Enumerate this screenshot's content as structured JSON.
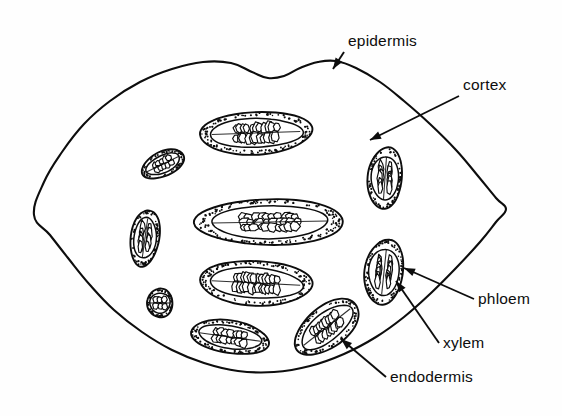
{
  "figure": {
    "kind": "botanical-line-drawing",
    "background_color": "#fefefe",
    "ink_color": "#0d0d0d",
    "width": 562,
    "height": 416
  },
  "labels": [
    {
      "id": "epidermis",
      "text": "epidermis",
      "x": 348,
      "y": 46,
      "anchor": "start",
      "leader": {
        "from": [
          344,
          52
        ],
        "to": [
          333,
          69
        ]
      }
    },
    {
      "id": "cortex",
      "text": "cortex",
      "x": 463,
      "y": 90,
      "anchor": "start",
      "leader": {
        "from": [
          459,
          96
        ],
        "to": [
          370,
          140
        ]
      }
    },
    {
      "id": "phloem",
      "text": "phloem",
      "x": 478,
      "y": 304,
      "anchor": "start",
      "leader": {
        "from": [
          474,
          299
        ],
        "to": [
          404,
          268
        ]
      }
    },
    {
      "id": "xylem",
      "text": "xylem",
      "x": 443,
      "y": 348,
      "anchor": "start",
      "leader": {
        "from": [
          439,
          343
        ],
        "to": [
          396,
          281
        ]
      }
    },
    {
      "id": "endodermis",
      "text": "endodermis",
      "x": 390,
      "y": 382,
      "anchor": "start",
      "leader": {
        "from": [
          386,
          377
        ],
        "to": [
          341,
          339
        ]
      }
    }
  ],
  "structures": {
    "epidermis": {
      "label": "epidermis",
      "description": "outer boundary line of the stem"
    },
    "cortex": {
      "label": "cortex",
      "description": "stippled ground tissue between epidermis and bundles"
    },
    "endodermis": {
      "label": "endodermis",
      "description": "sheath enclosing each vascular bundle"
    },
    "phloem": {
      "label": "phloem",
      "description": "small cells at outer side of bundle"
    },
    "xylem": {
      "label": "xylem",
      "description": "large vessel cells within bundle"
    }
  },
  "outline": {
    "name": "stem-epidermis-outline",
    "points": [
      [
        34,
        215
      ],
      [
        44,
        182
      ],
      [
        62,
        152
      ],
      [
        84,
        124
      ],
      [
        110,
        101
      ],
      [
        140,
        82
      ],
      [
        172,
        69
      ],
      [
        203,
        62
      ],
      [
        231,
        63
      ],
      [
        252,
        72
      ],
      [
        268,
        78
      ],
      [
        284,
        76
      ],
      [
        300,
        68
      ],
      [
        318,
        62
      ],
      [
        336,
        61
      ],
      [
        356,
        68
      ],
      [
        380,
        82
      ],
      [
        404,
        101
      ],
      [
        430,
        124
      ],
      [
        456,
        150
      ],
      [
        478,
        176
      ],
      [
        496,
        198
      ],
      [
        506,
        209
      ],
      [
        496,
        222
      ],
      [
        480,
        242
      ],
      [
        456,
        268
      ],
      [
        430,
        294
      ],
      [
        404,
        317
      ],
      [
        376,
        337
      ],
      [
        344,
        354
      ],
      [
        310,
        366
      ],
      [
        274,
        372
      ],
      [
        238,
        371
      ],
      [
        204,
        363
      ],
      [
        172,
        350
      ],
      [
        142,
        332
      ],
      [
        114,
        310
      ],
      [
        90,
        285
      ],
      [
        68,
        258
      ],
      [
        50,
        235
      ]
    ]
  },
  "bundles": [
    {
      "id": "bundle-top-center",
      "cx": 256,
      "cy": 133,
      "rx": 57,
      "ry": 21,
      "rot": -2,
      "cells": 22,
      "size": "large"
    },
    {
      "id": "bundle-mid-center",
      "cx": 270,
      "cy": 222,
      "rx": 74,
      "ry": 23,
      "rot": -1,
      "cells": 30,
      "size": "large"
    },
    {
      "id": "bundle-lower-center",
      "cx": 256,
      "cy": 283,
      "rx": 57,
      "ry": 22,
      "rot": 3,
      "cells": 24,
      "size": "large"
    },
    {
      "id": "bundle-bottom-left-center",
      "cx": 230,
      "cy": 337,
      "rx": 40,
      "ry": 16,
      "rot": 8,
      "cells": 14,
      "size": "medium"
    },
    {
      "id": "bundle-bottom-right",
      "cx": 327,
      "cy": 327,
      "rx": 38,
      "ry": 20,
      "rot": -38,
      "cells": 16,
      "size": "medium"
    },
    {
      "id": "bundle-right-upper",
      "cx": 385,
      "cy": 178,
      "rx": 17,
      "ry": 31,
      "rot": 4,
      "cells": 12,
      "size": "medium"
    },
    {
      "id": "bundle-right-lower",
      "cx": 384,
      "cy": 272,
      "rx": 19,
      "ry": 33,
      "rot": 6,
      "cells": 13,
      "size": "medium"
    },
    {
      "id": "bundle-upper-left",
      "cx": 163,
      "cy": 164,
      "rx": 23,
      "ry": 12,
      "rot": -26,
      "cells": 9,
      "size": "small"
    },
    {
      "id": "bundle-left-mid",
      "cx": 145,
      "cy": 238,
      "rx": 14,
      "ry": 29,
      "rot": 8,
      "cells": 10,
      "size": "small"
    },
    {
      "id": "bundle-left-lower",
      "cx": 160,
      "cy": 303,
      "rx": 13,
      "ry": 14,
      "rot": 0,
      "cells": 6,
      "size": "small"
    }
  ],
  "stipple": {
    "name": "cortex-stipple",
    "edge_band_density": "dense",
    "interior_density": "sparse",
    "dot_color": "#111111"
  }
}
